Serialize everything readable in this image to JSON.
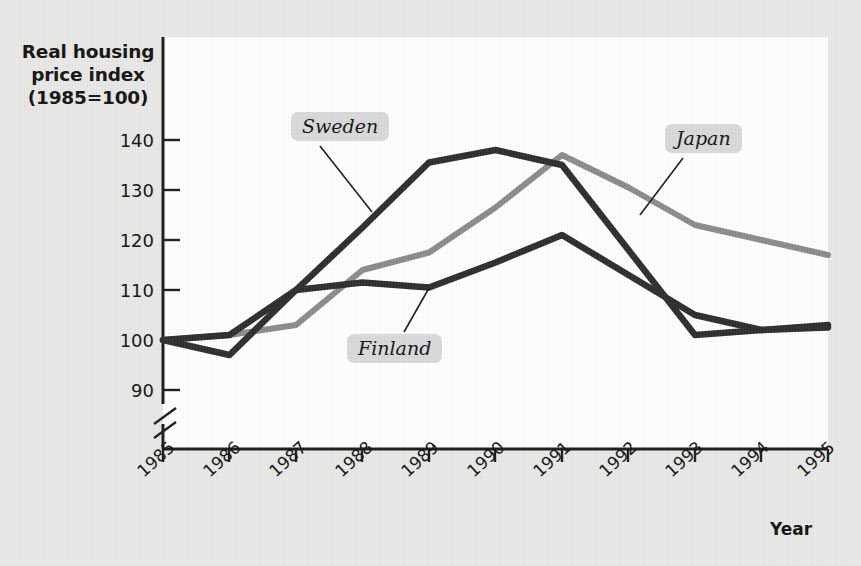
{
  "chart_data": {
    "type": "line",
    "title": "Real housing price index (1985=100)",
    "title_lines": [
      "Real housing",
      "price index",
      "(1985=100)"
    ],
    "xlabel": "Year",
    "ylabel": "Real housing price index (1985=100)",
    "categories": [
      "1985",
      "1986",
      "1987",
      "1988",
      "1989",
      "1990",
      "1991",
      "1992",
      "1993",
      "1994",
      "1995"
    ],
    "yticks": [
      90,
      100,
      110,
      120,
      130,
      140
    ],
    "ylim": [
      86,
      144
    ],
    "axis_break": true,
    "grid": false,
    "legend_position": "inline-callouts",
    "series": [
      {
        "name": "Sweden",
        "color": "#2b2b2b",
        "values": [
          100,
          97,
          110,
          122.5,
          135.5,
          138,
          135,
          118,
          101,
          102,
          102.5
        ]
      },
      {
        "name": "Japan",
        "color": "#8a8a8a",
        "values": [
          100,
          101,
          103,
          114,
          117.5,
          126.5,
          137,
          130.5,
          123,
          120,
          117
        ]
      },
      {
        "name": "Finland",
        "color": "#2b2b2b",
        "values": [
          100,
          101,
          110,
          111.5,
          110.5,
          115.5,
          121,
          113,
          105,
          102,
          103
        ]
      }
    ],
    "annotations": [
      {
        "text": "Sweden",
        "points_to_year": "1988",
        "points_to_value": 122.5
      },
      {
        "text": "Japan",
        "points_to_year": "1992",
        "points_to_value": 130.5
      },
      {
        "text": "Finland",
        "points_to_year": "1989",
        "points_to_value": 110.5
      }
    ]
  }
}
